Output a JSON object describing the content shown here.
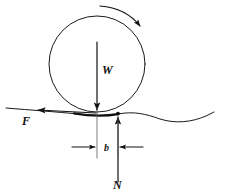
{
  "figure": {
    "background_color": "#ffffff",
    "line_color": "#111111",
    "labels": {
      "weight": "W",
      "friction": "F",
      "normal": "N",
      "offset": "b"
    },
    "annotations": {
      "rotation_direction": "clockwise",
      "weight_direction": "down",
      "friction_direction": "left",
      "normal_direction": "up",
      "offset_name": "b"
    },
    "geometry": {
      "circle_center_x": 97,
      "circle_center_y": 64,
      "circle_radius": 48,
      "contact_x": 118,
      "contact_y": 114,
      "ground_y": 114,
      "dimension_y": 147,
      "extension_left_x": 97,
      "extension_right_x": 118
    }
  }
}
